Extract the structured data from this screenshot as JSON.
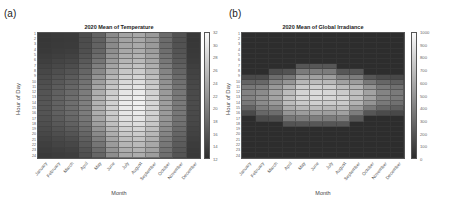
{
  "panels": {
    "a": {
      "label": "(a)"
    },
    "b": {
      "label": "(b)"
    }
  },
  "chart_data": [
    {
      "type": "heatmap",
      "title": "2020 Mean of Temperature",
      "xlabel": "Month",
      "ylabel": "Hour of Day",
      "categories": [
        "January",
        "February",
        "March",
        "April",
        "May",
        "June",
        "July",
        "August",
        "September",
        "October",
        "November",
        "December"
      ],
      "y": [
        "1",
        "2",
        "3",
        "4",
        "5",
        "6",
        "7",
        "8",
        "9",
        "10",
        "11",
        "12",
        "13",
        "14",
        "15",
        "16",
        "17",
        "18",
        "19",
        "20",
        "21",
        "22",
        "23",
        "24"
      ],
      "colorbar": {
        "min": 12,
        "max": 32,
        "ticks": [
          "32",
          "30",
          "28",
          "26",
          "24",
          "22",
          "20",
          "18",
          "16",
          "14",
          "12"
        ]
      },
      "monthly_base": [
        14.5,
        15.2,
        15.8,
        17.5,
        21.0,
        24.5,
        27.0,
        27.5,
        25.5,
        20.5,
        17.5,
        14.0
      ],
      "daily_amplitude": [
        1.5,
        2.0,
        2.5,
        2.5,
        4.0,
        3.5,
        3.5,
        3.5,
        3.0,
        2.5,
        2.0,
        1.0
      ],
      "grid": true,
      "legend_position": "right"
    },
    {
      "type": "heatmap",
      "title": "2020 Mean of Global Irradiance",
      "xlabel": "Month",
      "ylabel": "Hour of Day",
      "categories": [
        "January",
        "February",
        "March",
        "April",
        "May",
        "June",
        "July",
        "August",
        "September",
        "October",
        "November",
        "December"
      ],
      "y": [
        "1",
        "2",
        "3",
        "4",
        "5",
        "6",
        "7",
        "8",
        "9",
        "10",
        "11",
        "12",
        "13",
        "14",
        "15",
        "16",
        "17",
        "18",
        "19",
        "20",
        "21",
        "22",
        "23",
        "24"
      ],
      "colorbar": {
        "min": 0,
        "max": 1000,
        "ticks": [
          "1000",
          "900",
          "800",
          "700",
          "600",
          "500",
          "400",
          "300",
          "200",
          "100",
          "0"
        ]
      },
      "monthly_peak": [
        420,
        480,
        580,
        720,
        820,
        850,
        830,
        800,
        720,
        580,
        430,
        380
      ],
      "sunrise_hour": [
        9,
        9,
        8,
        8,
        7,
        7,
        7,
        8,
        8,
        9,
        9,
        9
      ],
      "sunset_hour": [
        16,
        17,
        17,
        18,
        18,
        18,
        18,
        18,
        17,
        16,
        16,
        16
      ],
      "grid": true,
      "legend_position": "right"
    }
  ]
}
